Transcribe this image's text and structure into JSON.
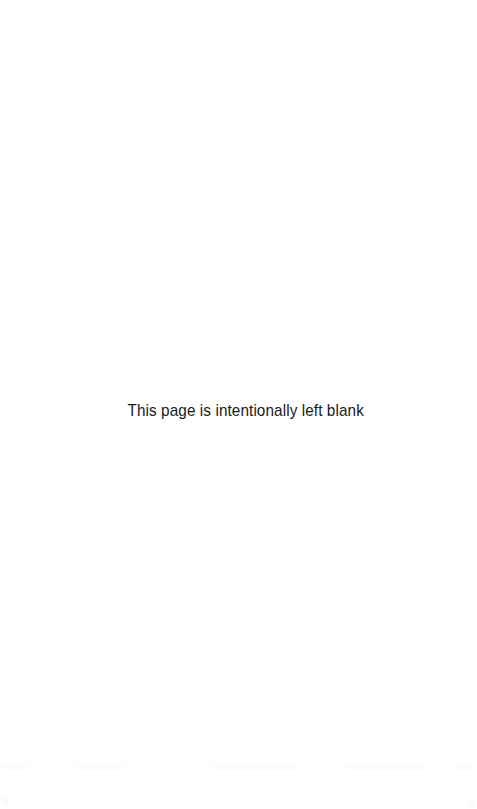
{
  "page": {
    "width": 477,
    "height": 809,
    "background_color": "#ffffff",
    "text_color": "#1a1a1a"
  },
  "content": {
    "notice": "This page is intentionally left blank"
  },
  "artifacts": {
    "description": "faint near-white marks along bottom edge",
    "color": "#fcfcfd",
    "segments": [
      {
        "left": 2,
        "width": 26
      },
      {
        "left": 76,
        "width": 48
      },
      {
        "left": 212,
        "width": 84
      },
      {
        "left": 346,
        "width": 80
      },
      {
        "left": 394,
        "width": 18
      },
      {
        "left": 455,
        "width": 20
      }
    ],
    "corners": [
      {
        "left": 2
      },
      {
        "left": 468
      }
    ]
  }
}
